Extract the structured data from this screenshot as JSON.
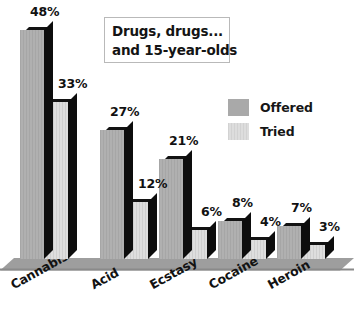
{
  "title": {
    "line1": "Drugs, drugs...",
    "line2": "and 15-year-olds"
  },
  "legend": {
    "items": [
      {
        "label": "Offered",
        "swatch": "offered",
        "color": "#a9a9a9"
      },
      {
        "label": "Tried",
        "swatch": "tried",
        "color": "#d6d6d6"
      }
    ]
  },
  "chart_data": {
    "type": "bar",
    "title": "Drugs, drugs... and 15-year-olds",
    "xlabel": "",
    "ylabel": "",
    "ylim": [
      0,
      48
    ],
    "grid": false,
    "legend_position": "upper-right",
    "categories": [
      "Cannabis",
      "Acid",
      "Ecstasy",
      "Cocaine",
      "Heroin"
    ],
    "series": [
      {
        "name": "Offered",
        "color": "#a9a9a9",
        "values": [
          48,
          27,
          21,
          8,
          7
        ],
        "labels": [
          "48%",
          "27%",
          "21%",
          "8%",
          "7%"
        ]
      },
      {
        "name": "Tried",
        "color": "#d6d6d6",
        "values": [
          33,
          12,
          6,
          4,
          3
        ],
        "labels": [
          "33%",
          "12%",
          "6%",
          "4%",
          "3%"
        ]
      }
    ],
    "value_suffix": "%"
  },
  "axis": {
    "category_labels": [
      "Cannabis",
      "Acid",
      "Ecstasy",
      "Cocaine",
      "Heroin"
    ]
  },
  "colors": {
    "offered": "#a9a9a9",
    "tried": "#d6d6d6",
    "bar_shadow": "#0d0d0d",
    "floor": "#9e9e9e",
    "background": "#ffffff",
    "text": "#111111"
  }
}
